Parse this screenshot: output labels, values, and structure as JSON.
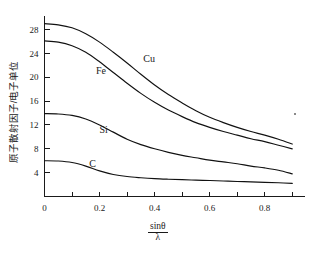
{
  "chart_data": {
    "type": "line",
    "title": "",
    "subtitle": "",
    "xlabel": "sinθ / λ",
    "xlabel_numerator": "sinθ",
    "xlabel_denominator": "λ",
    "ylabel": "原子散射因子/电子单位",
    "xlim": [
      0,
      0.93
    ],
    "ylim": [
      0,
      30.2
    ],
    "grid": false,
    "legend": "inline-curve-labels",
    "x_major_ticks": [
      0,
      0.2,
      0.4,
      0.6,
      0.8
    ],
    "x_major_tick_labels": [
      "0",
      "0.2",
      "0.4",
      "0.6",
      "0.8"
    ],
    "x_minor_ticks": [
      0.1,
      0.3,
      0.5,
      0.7,
      0.9
    ],
    "y_major_ticks": [
      4,
      8,
      12,
      16,
      20,
      24,
      28
    ],
    "y_major_tick_labels": [
      "4",
      "8",
      "12",
      "16",
      "20",
      "24",
      "28"
    ],
    "x": [
      0,
      0.05,
      0.1,
      0.15,
      0.2,
      0.25,
      0.3,
      0.35,
      0.4,
      0.45,
      0.5,
      0.55,
      0.6,
      0.65,
      0.7,
      0.75,
      0.8,
      0.85,
      0.9
    ],
    "series": [
      {
        "name": "Cu",
        "label": "Cu",
        "label_x": 0.38,
        "label_y": 22.6,
        "values": [
          29.0,
          28.8,
          28.3,
          27.3,
          25.9,
          24.2,
          22.4,
          20.5,
          18.7,
          17.1,
          15.7,
          14.4,
          13.3,
          12.4,
          11.6,
          10.9,
          10.3,
          9.6,
          8.8
        ]
      },
      {
        "name": "Fe",
        "label": "Fe",
        "label_x": 0.205,
        "label_y": 20.6,
        "values": [
          26.1,
          25.9,
          25.3,
          24.2,
          22.6,
          20.8,
          19.0,
          17.3,
          15.8,
          14.5,
          13.4,
          12.4,
          11.6,
          10.9,
          10.3,
          9.7,
          9.2,
          8.6,
          8.0
        ]
      },
      {
        "name": "Si",
        "label": "Si",
        "label_x": 0.215,
        "label_y": 10.6,
        "values": [
          13.9,
          13.85,
          13.6,
          13.0,
          12.0,
          10.8,
          9.6,
          8.7,
          8.0,
          7.4,
          6.9,
          6.5,
          6.1,
          5.8,
          5.5,
          5.1,
          4.8,
          4.4,
          3.8
        ]
      },
      {
        "name": "C",
        "label": "C",
        "label_x": 0.175,
        "label_y": 4.9,
        "values": [
          6.0,
          5.95,
          5.7,
          5.1,
          4.3,
          3.7,
          3.35,
          3.15,
          3.0,
          2.9,
          2.82,
          2.75,
          2.68,
          2.6,
          2.52,
          2.45,
          2.38,
          2.3,
          2.2
        ]
      }
    ],
    "colors": {
      "curve": "#111111",
      "axis": "#1a1a1a",
      "background": "#ffffff"
    }
  }
}
